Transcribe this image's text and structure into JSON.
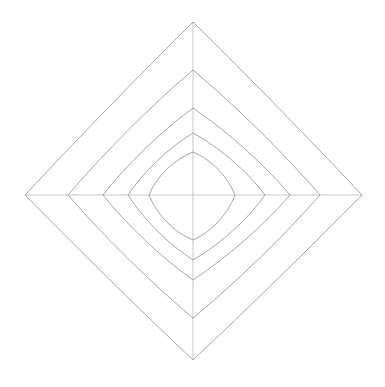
{
  "chart": {
    "type": "radar",
    "title": "",
    "background_color": "#ffffff",
    "axis_color": "#b0b0b0",
    "series_color": "#808080",
    "line_width": 0.7,
    "center": {
      "x": 193,
      "y": 195
    },
    "canvas": {
      "width": 385,
      "height": 387
    }
  },
  "chart_data": {
    "type": "line",
    "title": "",
    "subtitle": "",
    "xlabel": "",
    "ylabel": "",
    "grid": false,
    "legend_position": "none",
    "categories": [
      "up",
      "right",
      "down",
      "left"
    ],
    "axis_angles_deg": [
      90,
      0,
      270,
      180
    ],
    "axis_max_radius_px": [
      173,
      169,
      165,
      168
    ],
    "rlim": [
      0,
      173
    ],
    "series": [
      {
        "name": "series-1",
        "color": "#808080",
        "values": [
          173,
          169,
          165,
          168
        ],
        "radii_px": [
          173,
          169,
          165,
          168
        ],
        "curvature": 0.02
      },
      {
        "name": "series-2",
        "color": "#808080",
        "values": [
          125,
          127,
          123,
          125
        ],
        "radii_px": [
          125,
          127,
          123,
          125
        ],
        "curvature": 0.08
      },
      {
        "name": "series-3",
        "color": "#808080",
        "values": [
          87,
          97,
          85,
          90
        ],
        "radii_px": [
          87,
          97,
          85,
          90
        ],
        "curvature": 0.14
      },
      {
        "name": "series-4",
        "color": "#808080",
        "values": [
          62,
          72,
          65,
          65
        ],
        "radii_px": [
          62,
          72,
          65,
          65
        ],
        "curvature": 0.22
      },
      {
        "name": "series-5",
        "color": "#808080",
        "values": [
          43,
          42,
          45,
          44
        ],
        "radii_px": [
          43,
          42,
          45,
          44
        ],
        "curvature": 0.42
      }
    ],
    "axes": [
      {
        "label": "up",
        "angle_deg": 90,
        "length_px": 173
      },
      {
        "label": "right",
        "angle_deg": 0,
        "length_px": 169
      },
      {
        "label": "down",
        "angle_deg": 270,
        "length_px": 165
      },
      {
        "label": "left",
        "angle_deg": 180,
        "length_px": 168
      }
    ]
  }
}
